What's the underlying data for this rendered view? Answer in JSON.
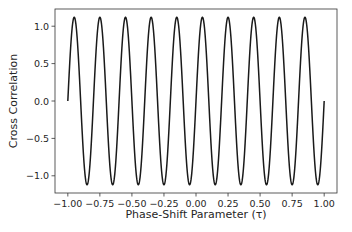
{
  "chart_data": {
    "type": "line",
    "title": "",
    "xlabel": "Phase-Shift Parameter (τ)",
    "ylabel": "Cross Correlation",
    "xlim": [
      -1.1,
      1.1
    ],
    "ylim": [
      -1.23,
      1.23
    ],
    "xticks": [
      -1.0,
      -0.75,
      -0.5,
      -0.25,
      0.0,
      0.25,
      0.5,
      0.75,
      1.0
    ],
    "xtick_labels": [
      "−1.00",
      "−0.75",
      "−0.50",
      "−0.25",
      "0.00",
      "0.25",
      "0.50",
      "0.75",
      "1.00"
    ],
    "yticks": [
      1.0,
      0.5,
      0.0,
      -0.5,
      -1.0
    ],
    "ytick_labels": [
      "1.0",
      "0.5",
      "0.0",
      "−0.5",
      "−1.0"
    ],
    "grid": false,
    "legend": null,
    "series": [
      {
        "name": "cross correlation",
        "color": "#1a1a1a",
        "function": "y = 1.12 * sin(10*pi*tau), tau in [-1, 1]",
        "amplitude": 1.12,
        "frequency": 5,
        "x_range": [
          -1.0,
          1.0
        ],
        "key_points": {
          "start": [
            -1.0,
            0.0
          ],
          "end": [
            1.0,
            0.0
          ],
          "peaks_x": [
            -0.85,
            -0.65,
            -0.45,
            -0.25,
            -0.05,
            0.15,
            0.35,
            0.55,
            0.75,
            0.95
          ],
          "troughs_x": [
            -0.95,
            -0.75,
            -0.55,
            -0.35,
            -0.15,
            0.05,
            0.25,
            0.45,
            0.65,
            0.85
          ],
          "peak_value": 1.12,
          "trough_value": -1.12
        }
      }
    ]
  }
}
